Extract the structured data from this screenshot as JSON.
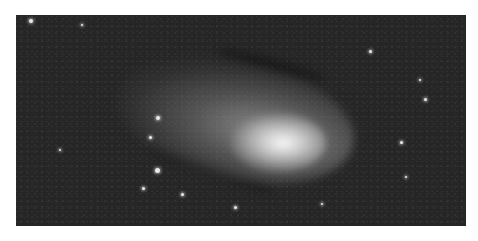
{
  "image": {
    "subject": "comet with glowing coma and dust tail against a star field",
    "colors": {
      "page_background": "#ffffff",
      "sky": "#262626",
      "coma_core": "#ffffff"
    },
    "stars": [
      {
        "x": 31,
        "y": 21,
        "r": 2
      },
      {
        "x": 158,
        "y": 118,
        "r": 2
      },
      {
        "x": 150,
        "y": 137,
        "r": 1.5
      },
      {
        "x": 157,
        "y": 170,
        "r": 2.5
      },
      {
        "x": 143,
        "y": 188,
        "r": 1.5
      },
      {
        "x": 182,
        "y": 194,
        "r": 1.5
      },
      {
        "x": 370,
        "y": 51,
        "r": 1.5
      },
      {
        "x": 425,
        "y": 99,
        "r": 1.5
      },
      {
        "x": 401,
        "y": 142,
        "r": 1.5
      },
      {
        "x": 406,
        "y": 177,
        "r": 1.2
      },
      {
        "x": 235,
        "y": 207,
        "r": 1.5
      },
      {
        "x": 322,
        "y": 204,
        "r": 1.2
      },
      {
        "x": 82,
        "y": 25,
        "r": 1
      },
      {
        "x": 420,
        "y": 80,
        "r": 1
      },
      {
        "x": 60,
        "y": 150,
        "r": 1
      }
    ]
  }
}
